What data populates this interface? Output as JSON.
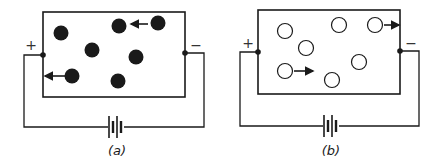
{
  "colors": {
    "ink": "#1a1a1a",
    "background": "#ffffff"
  },
  "panels": [
    {
      "id": "a",
      "label": "(a)",
      "plus_sign": "+",
      "minus_sign": "−",
      "particle_type": "filled",
      "particles": [
        [
          61,
          33
        ],
        [
          119,
          26
        ],
        [
          158,
          23
        ],
        [
          92,
          50
        ],
        [
          136,
          57
        ],
        [
          72,
          76
        ],
        [
          118,
          81
        ]
      ],
      "arrows": [
        {
          "from": [
            148,
            24
          ],
          "to": [
            131,
            24
          ],
          "direction": "left"
        },
        {
          "from": [
            65,
            76
          ],
          "to": [
            45,
            76
          ],
          "direction": "left"
        }
      ],
      "box": {
        "x": 43,
        "y": 12,
        "w": 142,
        "h": 85
      },
      "left_terminal": [
        43,
        55
      ],
      "right_terminal": [
        185,
        53
      ],
      "wire_left_x": 24,
      "wire_right_x": 204,
      "wire_bottom_y": 127,
      "battery_x": 116,
      "label_pos": [
        117,
        155
      ],
      "plus_pos": [
        31,
        50
      ],
      "minus_pos": [
        196,
        50
      ]
    },
    {
      "id": "b",
      "label": "(b)",
      "plus_sign": "+",
      "minus_sign": "−",
      "particle_type": "hollow",
      "particles": [
        [
          285,
          31
        ],
        [
          339,
          25
        ],
        [
          375,
          25
        ],
        [
          306,
          48
        ],
        [
          359,
          62
        ],
        [
          285,
          71
        ],
        [
          332,
          80
        ]
      ],
      "arrows": [
        {
          "from": [
            384,
            25
          ],
          "to": [
            399,
            25
          ],
          "direction": "right"
        },
        {
          "from": [
            294,
            71
          ],
          "to": [
            313,
            71
          ],
          "direction": "right"
        }
      ],
      "box": {
        "x": 258,
        "y": 10,
        "w": 142,
        "h": 84
      },
      "left_terminal": [
        258,
        52
      ],
      "right_terminal": [
        400,
        51
      ],
      "wire_left_x": 240,
      "wire_right_x": 419,
      "wire_bottom_y": 126,
      "battery_x": 331,
      "label_pos": [
        331,
        155
      ],
      "plus_pos": [
        248,
        48
      ],
      "minus_pos": [
        411,
        48
      ]
    }
  ]
}
